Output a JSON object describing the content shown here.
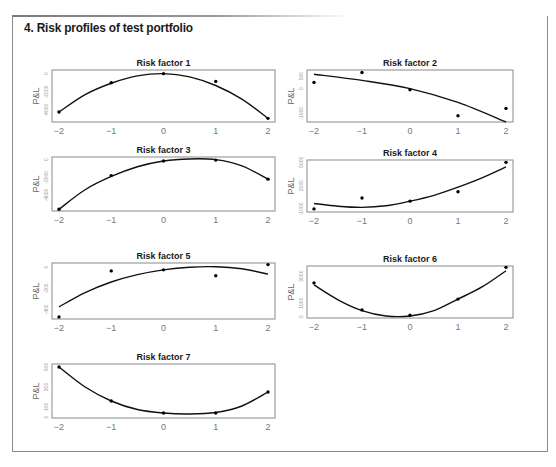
{
  "page": {
    "title": "4. Risk profiles of test portfolio"
  },
  "chart_data": [
    {
      "type": "scatter",
      "title": "Risk factor 1",
      "xlabel": "",
      "ylabel": "P&L",
      "xticks": [
        -2,
        -1,
        0,
        1,
        2
      ],
      "yticks": [
        0,
        -2000,
        -4000
      ],
      "ylim": [
        -5300,
        400
      ],
      "points": {
        "x": [
          -2,
          -1,
          0,
          1,
          2
        ],
        "y": [
          -4200,
          -1000,
          0,
          -850,
          -4900
        ]
      },
      "fit": {
        "x": [
          -2,
          -1.5,
          -1,
          -0.5,
          0,
          0.5,
          1,
          1.5,
          2
        ],
        "y": [
          -4200,
          -2300,
          -1050,
          -250,
          0,
          -350,
          -1300,
          -2800,
          -4900
        ]
      }
    },
    {
      "type": "scatter",
      "title": "Risk factor 2",
      "xlabel": "",
      "ylabel": "P&L",
      "xticks": [
        -2,
        -1,
        0,
        1,
        2
      ],
      "yticks": [
        500,
        0,
        -1000
      ],
      "ylim": [
        -1350,
        750
      ],
      "points": {
        "x": [
          -2,
          -1,
          0,
          1,
          2
        ],
        "y": [
          250,
          650,
          -50,
          -1100,
          -800
        ]
      },
      "fit": {
        "x": [
          -2,
          -1,
          0,
          1,
          2
        ],
        "y": [
          580,
          330,
          0,
          -560,
          -1350
        ]
      }
    },
    {
      "type": "scatter",
      "title": "Risk factor 3",
      "xlabel": "",
      "ylabel": "P&L",
      "xticks": [
        -2,
        -1,
        0,
        1,
        2
      ],
      "yticks": [
        0,
        -2000,
        -4000
      ],
      "ylim": [
        -5800,
        300
      ],
      "points": {
        "x": [
          -2,
          -1,
          0,
          1,
          2
        ],
        "y": [
          -5600,
          -1800,
          -150,
          -50,
          -2200
        ]
      },
      "fit": {
        "x": [
          -2,
          -1.5,
          -1,
          -0.5,
          0,
          0.5,
          1,
          1.5,
          2
        ],
        "y": [
          -5600,
          -3400,
          -1900,
          -800,
          -150,
          80,
          0,
          -700,
          -2200
        ]
      }
    },
    {
      "type": "scatter",
      "title": "Risk factor 4",
      "xlabel": "",
      "ylabel": "P&L",
      "xticks": [
        -2,
        -1,
        0,
        1,
        2
      ],
      "yticks": [
        -1000,
        2000,
        5000
      ],
      "ylim": [
        -1400,
        5300
      ],
      "points": {
        "x": [
          -2,
          -1,
          0,
          1,
          2
        ],
        "y": [
          -1000,
          400,
          0,
          1200,
          5000
        ]
      },
      "fit": {
        "x": [
          -2,
          -1.5,
          -1,
          -0.5,
          0,
          0.5,
          1,
          1.5,
          2
        ],
        "y": [
          -300,
          -650,
          -800,
          -600,
          0,
          750,
          1800,
          3000,
          4400
        ]
      }
    },
    {
      "type": "scatter",
      "title": "Risk factor 5",
      "xlabel": "",
      "ylabel": "P&L",
      "xticks": [
        -2,
        -1,
        0,
        1,
        2
      ],
      "yticks": [
        0,
        -200,
        -400
      ],
      "ylim": [
        -490,
        40
      ],
      "points": {
        "x": [
          -2,
          -1,
          0,
          1,
          2
        ],
        "y": [
          -470,
          -35,
          -25,
          -80,
          25
        ]
      },
      "fit": {
        "x": [
          -2,
          -1.5,
          -1,
          -0.5,
          0,
          0.5,
          1,
          1.5,
          2
        ],
        "y": [
          -375,
          -240,
          -140,
          -70,
          -25,
          0,
          5,
          -15,
          -65
        ]
      }
    },
    {
      "type": "scatter",
      "title": "Risk factor 6",
      "xlabel": "",
      "ylabel": "P&L",
      "xticks": [
        -2,
        -1,
        0,
        1,
        2
      ],
      "yticks": [
        0,
        1000,
        3000
      ],
      "ylim": [
        -100,
        3750
      ],
      "points": {
        "x": [
          -2,
          -1,
          0,
          1,
          2
        ],
        "y": [
          2500,
          500,
          100,
          1300,
          3650
        ]
      },
      "fit": {
        "x": [
          -2,
          -1.5,
          -1,
          -0.5,
          0,
          0.5,
          1,
          1.5,
          2
        ],
        "y": [
          2350,
          1250,
          450,
          50,
          50,
          450,
          1300,
          2200,
          3400
        ]
      }
    },
    {
      "type": "scatter",
      "title": "Risk factor 7",
      "xlabel": "",
      "ylabel": "P&L",
      "xticks": [
        -2,
        -1,
        0,
        1,
        2
      ],
      "yticks": [
        0,
        100,
        300,
        500
      ],
      "ylim": [
        -10,
        530
      ],
      "points": {
        "x": [
          -2,
          -1,
          0,
          1,
          2
        ],
        "y": [
          500,
          160,
          40,
          40,
          250
        ]
      },
      "fit": {
        "x": [
          -2,
          -1.5,
          -1,
          -0.5,
          0,
          0.5,
          1,
          1.5,
          2
        ],
        "y": [
          500,
          300,
          160,
          75,
          40,
          30,
          45,
          110,
          250
        ]
      }
    }
  ]
}
